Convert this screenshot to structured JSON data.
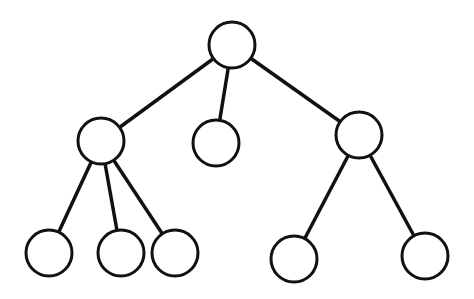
{
  "diagram": {
    "type": "tree",
    "stroke_color": "#111111",
    "fill_color": "#ffffff",
    "node_radius": 23,
    "nodes": [
      {
        "id": "root",
        "x": 232,
        "y": 45
      },
      {
        "id": "a",
        "x": 101,
        "y": 141
      },
      {
        "id": "b",
        "x": 216,
        "y": 143
      },
      {
        "id": "c",
        "x": 359,
        "y": 135
      },
      {
        "id": "a1",
        "x": 49,
        "y": 253
      },
      {
        "id": "a2",
        "x": 121,
        "y": 253
      },
      {
        "id": "a3",
        "x": 175,
        "y": 253
      },
      {
        "id": "c1",
        "x": 294,
        "y": 259
      },
      {
        "id": "c2",
        "x": 425,
        "y": 256
      }
    ],
    "edges": [
      [
        "root",
        "a"
      ],
      [
        "root",
        "b"
      ],
      [
        "root",
        "c"
      ],
      [
        "a",
        "a1"
      ],
      [
        "a",
        "a2"
      ],
      [
        "a",
        "a3"
      ],
      [
        "c",
        "c1"
      ],
      [
        "c",
        "c2"
      ]
    ]
  }
}
